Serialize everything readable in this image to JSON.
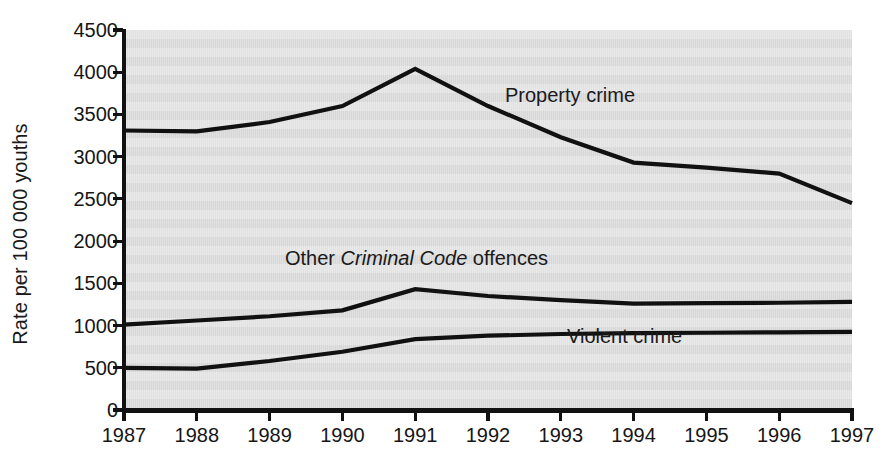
{
  "chart_data": {
    "type": "line",
    "title": "",
    "xlabel": "",
    "ylabel": "Rate per 100 000 youths",
    "x": [
      1987,
      1988,
      1989,
      1990,
      1991,
      1992,
      1993,
      1994,
      1995,
      1996,
      1997
    ],
    "categories": [
      "1987",
      "1988",
      "1989",
      "1990",
      "1991",
      "1992",
      "1993",
      "1994",
      "1995",
      "1996",
      "1997"
    ],
    "xlim": [
      1987,
      1997
    ],
    "ylim": [
      0,
      4500
    ],
    "yticks": [
      0,
      500,
      1000,
      1500,
      2000,
      2500,
      3000,
      3500,
      4000,
      4500
    ],
    "ytick_labels": [
      "0",
      "500",
      "1000",
      "1500",
      "2000",
      "2500",
      "3000",
      "3500",
      "4000",
      "4500"
    ],
    "grid": false,
    "background_bands": true,
    "legend": "inline-annotations",
    "series": [
      {
        "name": "Property crime",
        "label_text": "Property crime",
        "label_italic_part": "",
        "color": "#111111",
        "values": [
          3310,
          3300,
          3410,
          3600,
          4040,
          3600,
          3230,
          2930,
          2870,
          2800,
          2450
        ]
      },
      {
        "name": "Other Criminal Code offences",
        "label_text": "Other Criminal Code offences",
        "label_italic_part": "Criminal Code",
        "color": "#111111",
        "values": [
          1010,
          1060,
          1110,
          1180,
          1430,
          1350,
          1300,
          1260,
          1265,
          1270,
          1280
        ]
      },
      {
        "name": "Violent crime",
        "label_text": "Violent crime",
        "label_italic_part": "",
        "color": "#111111",
        "values": [
          500,
          490,
          580,
          690,
          840,
          880,
          900,
          910,
          915,
          920,
          925
        ]
      }
    ],
    "annotations": [
      {
        "text": "Property crime",
        "series": "Property crime",
        "x_px": 505,
        "y_px": 95
      },
      {
        "text_prefix": "Other ",
        "text_italic": "Criminal Code",
        "text_suffix": " offences",
        "series": "Other Criminal Code offences",
        "x_px": 285,
        "y_px": 258
      },
      {
        "text": "Violent crime",
        "series": "Violent crime",
        "x_px": 567,
        "y_px": 336
      }
    ]
  },
  "axis": {
    "y_title": "Rate per 100 000 youths",
    "y_ticks": [
      "4500",
      "4000",
      "3500",
      "3000",
      "2500",
      "2000",
      "1500",
      "1000",
      "500",
      "0"
    ],
    "x_ticks": [
      "1987",
      "1988",
      "1989",
      "1990",
      "1991",
      "1992",
      "1993",
      "1994",
      "1995",
      "1996",
      "1997"
    ]
  },
  "annotations": {
    "property_crime": "Property crime",
    "other_prefix": "Other ",
    "other_italic": "Criminal Code",
    "other_suffix": " offences",
    "violent_crime": "Violent crime"
  }
}
